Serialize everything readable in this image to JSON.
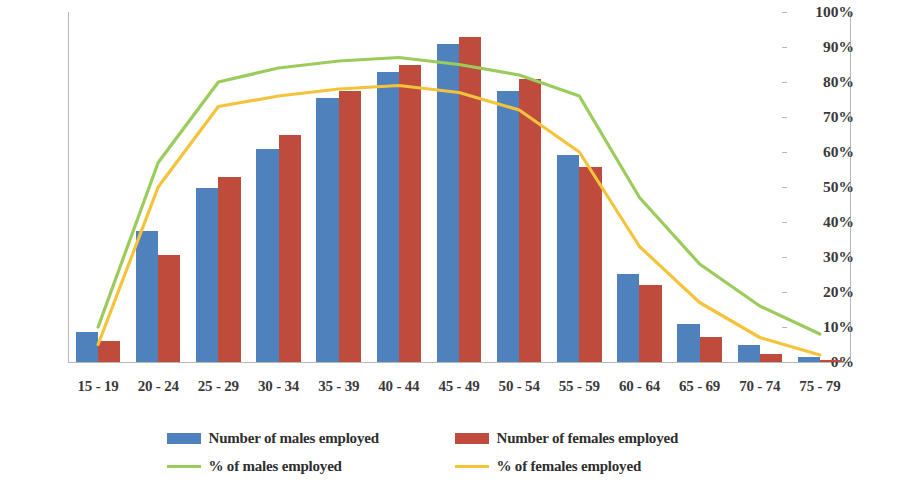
{
  "chart_data": {
    "type": "bar",
    "title": "",
    "subtitle": "",
    "xlabel": "",
    "ylabel": "",
    "y2label": "",
    "grid": false,
    "legend_position": "bottom",
    "categories": [
      "15 - 19",
      "20 - 24",
      "25 - 29",
      "30 - 34",
      "35 - 39",
      "40 - 44",
      "45 - 49",
      "50 - 54",
      "55 - 59",
      "60 - 64",
      "65 - 69",
      "70 - 74",
      "75 - 79"
    ],
    "ylim": [
      0,
      4000
    ],
    "yticks": [
      0,
      500,
      1000,
      1500,
      2000,
      2500,
      3000,
      3500,
      4000
    ],
    "ytick_labels": [
      "0",
      "500",
      "1000",
      "1500",
      "2000",
      "2500",
      "3000",
      "3500",
      "4000"
    ],
    "y2lim": [
      0,
      100
    ],
    "y2ticks": [
      0,
      10,
      20,
      30,
      40,
      50,
      60,
      70,
      80,
      90,
      100
    ],
    "y2tick_labels": [
      "0%",
      "10%",
      "20%",
      "30%",
      "40%",
      "50%",
      "60%",
      "70%",
      "80%",
      "90%",
      "100%"
    ],
    "series": [
      {
        "name": "Number of males employed",
        "type": "bar",
        "axis": "left",
        "color": "#4F81BD",
        "values": [
          340,
          1500,
          1990,
          2440,
          3020,
          3320,
          3640,
          3100,
          2370,
          1010,
          430,
          190,
          60
        ]
      },
      {
        "name": "Number of females employed",
        "type": "bar",
        "axis": "left",
        "color": "#BE4B3B",
        "values": [
          240,
          1220,
          2110,
          2600,
          3100,
          3400,
          3710,
          3240,
          2230,
          880,
          290,
          90,
          25
        ]
      },
      {
        "name": "% of males employed",
        "type": "line",
        "axis": "right",
        "color": "#9BCB5B",
        "values": [
          10,
          57,
          80,
          84,
          86,
          87,
          85,
          82,
          76,
          47,
          28,
          16,
          8
        ]
      },
      {
        "name": "% of females employed",
        "type": "line",
        "axis": "right",
        "color": "#F5C33B",
        "values": [
          5,
          50,
          73,
          76,
          78,
          79,
          77,
          72,
          60,
          33,
          17,
          7,
          2
        ]
      }
    ]
  },
  "legend": {
    "items": [
      {
        "label": "Number of males employed",
        "marker": "box",
        "color": "#4F81BD"
      },
      {
        "label": "Number of females employed",
        "marker": "box",
        "color": "#BE4B3B"
      },
      {
        "label": "% of males employed",
        "marker": "line",
        "color": "#9BCB5B"
      },
      {
        "label": "% of females employed",
        "marker": "line",
        "color": "#F5C33B"
      }
    ]
  }
}
